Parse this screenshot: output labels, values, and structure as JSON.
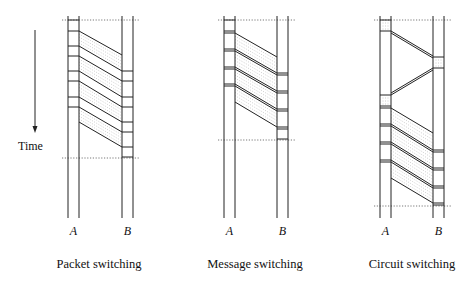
{
  "time_axis": {
    "label": "Time",
    "x": 35,
    "y1": 30,
    "y2": 133,
    "label_x": 18,
    "label_y": 150
  },
  "panels": [
    {
      "id": "packet",
      "title": "Packet switching",
      "title_x": 99,
      "title_y": 268,
      "a_label": "A",
      "b_label": "B",
      "a_x": [
        68,
        79
      ],
      "b_x": [
        122,
        133
      ],
      "line_top": 16,
      "line_bottom": 218,
      "label_y": 235,
      "dotted": [
        {
          "y": 20,
          "x1": 62,
          "x2": 140
        },
        {
          "y": 158,
          "x1": 62,
          "x2": 140
        }
      ],
      "a_marks": [
        20,
        31,
        46,
        56,
        71,
        81,
        97,
        107
      ],
      "b_marks": [
        71,
        81,
        97,
        107,
        122,
        132,
        147,
        157
      ],
      "slants": [
        [
          31,
          55
        ],
        [
          46,
          71
        ],
        [
          56,
          81
        ],
        [
          71,
          97
        ],
        [
          81,
          107
        ],
        [
          97,
          122
        ],
        [
          107,
          132
        ],
        [
          122,
          147
        ]
      ],
      "bands": [
        [
          31,
          46,
          55,
          71
        ],
        [
          56,
          71,
          81,
          97
        ],
        [
          81,
          97,
          107,
          122
        ],
        [
          107,
          122,
          132,
          147
        ]
      ],
      "double": false
    },
    {
      "id": "message",
      "title": "Message switching",
      "title_x": 255,
      "title_y": 268,
      "a_label": "A",
      "b_label": "B",
      "a_x": [
        224,
        235
      ],
      "b_x": [
        277,
        288
      ],
      "line_top": 16,
      "line_bottom": 218,
      "label_y": 235,
      "dotted": [
        {
          "y": 20,
          "x1": 218,
          "x2": 295
        },
        {
          "y": 140,
          "x1": 218,
          "x2": 295
        }
      ],
      "a_marks": [
        20,
        31,
        33,
        49,
        51,
        67,
        69,
        84,
        86
      ],
      "b_marks": [
        73,
        75,
        91,
        93,
        109,
        111,
        127,
        129,
        139
      ],
      "slants": [
        [
          33,
          57
        ],
        [
          49,
          73
        ],
        [
          51,
          75
        ],
        [
          67,
          91
        ],
        [
          69,
          93
        ],
        [
          84,
          109
        ],
        [
          86,
          111
        ],
        [
          102,
          127
        ]
      ],
      "bands": [
        [
          33,
          49,
          57,
          73
        ],
        [
          51,
          67,
          75,
          91
        ],
        [
          69,
          84,
          93,
          109
        ],
        [
          86,
          102,
          111,
          127
        ]
      ],
      "double": true
    },
    {
      "id": "circuit",
      "title": "Circuit switching",
      "title_x": 412,
      "title_y": 268,
      "a_label": "A",
      "b_label": "B",
      "a_x": [
        380,
        391
      ],
      "b_x": [
        433,
        444
      ],
      "line_top": 16,
      "line_bottom": 218,
      "label_y": 235,
      "dotted": [
        {
          "y": 20,
          "x1": 374,
          "x2": 452
        },
        {
          "y": 206,
          "x1": 374,
          "x2": 452
        }
      ],
      "a_marks": [
        20,
        31,
        95,
        106,
        108,
        124,
        126,
        142,
        144,
        160,
        162
      ],
      "b_marks": [
        57,
        68,
        150,
        152,
        168,
        170,
        186,
        188,
        203,
        205
      ],
      "setup_slants": [
        [
          31,
          56
        ],
        [
          33,
          58
        ]
      ],
      "ack_slants": [
        [
          68,
          93
        ],
        [
          70,
          95
        ]
      ],
      "slants": [
        [
          108,
          133
        ],
        [
          124,
          150
        ],
        [
          126,
          152
        ],
        [
          142,
          168
        ],
        [
          144,
          170
        ],
        [
          160,
          186
        ],
        [
          162,
          188
        ],
        [
          178,
          203
        ]
      ],
      "bands": [
        [
          108,
          124,
          133,
          150
        ],
        [
          126,
          142,
          152,
          168
        ],
        [
          144,
          160,
          170,
          186
        ],
        [
          162,
          178,
          188,
          203
        ]
      ],
      "a_box_dots": [
        [
          20,
          31
        ],
        [
          95,
          106
        ]
      ],
      "b_box_dots": [
        [
          57,
          68
        ]
      ],
      "double": true
    }
  ]
}
